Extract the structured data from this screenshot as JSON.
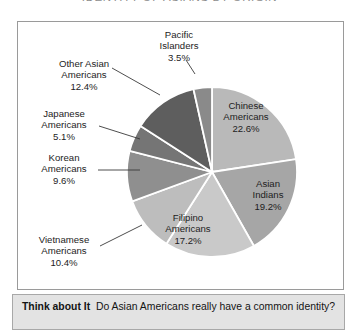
{
  "title": "IDENTITY OF ASIANS BY ORIGIN",
  "caption": {
    "lead": "Think about It",
    "question": "Do Asian Americans really have a common identity?"
  },
  "chart_data": {
    "type": "pie",
    "title": "IDENTITY OF ASIANS BY ORIGIN",
    "xlabel": "",
    "ylabel": "",
    "units": "percent",
    "legend_position": "none",
    "labels_inside": [
      "Chinese Americans",
      "Asian Indians",
      "Filipino Americans"
    ],
    "categories": [
      "Chinese Americans",
      "Asian Indians",
      "Filipino Americans",
      "Vietnamese Americans",
      "Korean Americans",
      "Japanese Americans",
      "Other Asian Americans",
      "Pacific Islanders"
    ],
    "values": [
      22.6,
      19.2,
      17.2,
      10.4,
      9.6,
      5.1,
      12.4,
      3.5
    ],
    "value_labels": [
      "22.6%",
      "19.2%",
      "17.2%",
      "10.4%",
      "9.6%",
      "5.1%",
      "12.4%",
      "3.5%"
    ],
    "colors": [
      "#b9b9b9",
      "#a6a6a6",
      "#c9c9c9",
      "#bdbdbd",
      "#8f8f8f",
      "#757575",
      "#5e5e5e",
      "#8a8a8a"
    ]
  },
  "slices": [
    {
      "name": "Chinese Americans",
      "line1": "Chinese",
      "line2": "Americans",
      "value": "22.6%",
      "color": "#b9b9b9"
    },
    {
      "name": "Asian Indians",
      "line1": "Asian",
      "line2": "Indians",
      "value": "19.2%",
      "color": "#a6a6a6"
    },
    {
      "name": "Filipino Americans",
      "line1": "Filipino",
      "line2": "Americans",
      "value": "17.2%",
      "color": "#c9c9c9"
    },
    {
      "name": "Vietnamese Americans",
      "line1": "Vietnamese",
      "line2": "Americans",
      "value": "10.4%",
      "color": "#bdbdbd"
    },
    {
      "name": "Korean Americans",
      "line1": "Korean",
      "line2": "Americans",
      "value": "9.6%",
      "color": "#8f8f8f"
    },
    {
      "name": "Japanese Americans",
      "line1": "Japanese",
      "line2": "Americans",
      "value": "5.1%",
      "color": "#757575"
    },
    {
      "name": "Other Asian Americans",
      "line1": "Other Asian",
      "line2": "Americans",
      "value": "12.4%",
      "color": "#5e5e5e"
    },
    {
      "name": "Pacific Islanders",
      "line1": "Pacific",
      "line2": "Islanders",
      "value": "3.5%",
      "color": "#8a8a8a"
    }
  ]
}
